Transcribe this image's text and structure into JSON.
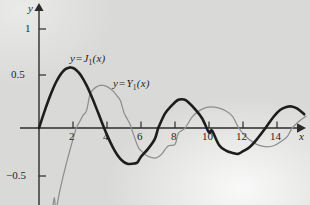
{
  "chart_data": {
    "type": "line",
    "title": "",
    "xlabel": "x",
    "ylabel": "y",
    "xlim": [
      -0.3,
      15.8
    ],
    "ylim": [
      -0.75,
      1.18
    ],
    "grid": false,
    "legend_position": "inline-annotations",
    "xticks": [
      2,
      4,
      6,
      8,
      10,
      12,
      14
    ],
    "xtick_labels": [
      "2",
      "4",
      "6",
      "8",
      "10",
      "12",
      "14"
    ],
    "yticks": [
      1,
      0.5,
      -0.5
    ],
    "ytick_labels": [
      "1",
      "0.5",
      "−0.5"
    ],
    "annotations": [
      {
        "text_y": "y",
        "text_eq": "=",
        "text_fn": "J",
        "text_sub": "1",
        "text_arg": "(x)",
        "at_x": 2.6,
        "at_y": 0.72
      },
      {
        "text_y": "y",
        "text_eq": "=",
        "text_fn": "Y",
        "text_sub": "1",
        "text_arg": "(x)",
        "at_x": 5.1,
        "at_y": 0.45
      }
    ],
    "series": [
      {
        "name": "J_1(x)",
        "label": "y = J₁(x)",
        "color": "#1d1d1d",
        "linewidth": 2.6,
        "x": [
          0,
          0.2,
          0.4,
          0.6,
          0.8,
          1,
          1.2,
          1.4,
          1.6,
          1.8,
          1.841,
          2,
          2.2,
          2.4,
          2.6,
          2.8,
          3,
          3.2,
          3.4,
          3.6,
          3.8,
          3.832,
          4,
          4.2,
          4.4,
          4.6,
          4.8,
          5,
          5.2,
          5.331,
          5.6,
          5.8,
          6,
          6.4,
          6.8,
          7,
          7.016,
          7.4,
          7.8,
          8.2,
          8.536,
          8.8,
          9.2,
          9.6,
          10,
          10.174,
          10.6,
          11,
          11.4,
          11.706,
          12,
          12.4,
          12.8,
          13.324,
          13.8,
          14.2,
          14.6,
          14.864,
          15.2,
          15.6
        ],
        "y": [
          0,
          0.0995,
          0.196,
          0.2867,
          0.3688,
          0.4401,
          0.4983,
          0.5419,
          0.5699,
          0.5815,
          0.5819,
          0.5767,
          0.556,
          0.5202,
          0.4708,
          0.4097,
          0.3391,
          0.2613,
          0.1792,
          0.0955,
          0.0128,
          0,
          -0.066,
          -0.1386,
          -0.2028,
          -0.2566,
          -0.2985,
          -0.3276,
          -0.3432,
          -0.3461,
          -0.3414,
          -0.329,
          -0.2767,
          -0.2028,
          -0.1096,
          -0.0047,
          0,
          0.1352,
          0.215,
          0.2715,
          0.273,
          0.2453,
          0.1768,
          0.0915,
          -0.0435,
          -0.0249,
          -0.1655,
          -0.2167,
          -0.2402,
          -0.249,
          -0.2234,
          -0.183,
          -0.1119,
          0,
          0.1087,
          0.1757,
          0.2045,
          0.2061,
          0.186,
          0.1322
        ]
      },
      {
        "name": "Y_1(x)",
        "label": "y = Y₁(x)",
        "color": "#8e8e8e",
        "linewidth": 1.25,
        "x": [
          0.62,
          0.7,
          0.8,
          0.9,
          1,
          1.2,
          1.4,
          1.6,
          1.8,
          2,
          2.197,
          2.4,
          2.6,
          2.8,
          3,
          3.2,
          3.4,
          3.6,
          3.683,
          3.8,
          4,
          4.2,
          4.4,
          4.6,
          4.8,
          5,
          5.2,
          5.4,
          5.429,
          5.8,
          6,
          6.4,
          6.8,
          7,
          7.2,
          7.6,
          8,
          8.2,
          8.596,
          9,
          9.4,
          9.8,
          10.1,
          10.5,
          11,
          11.4,
          11.749,
          12.2,
          12.6,
          13,
          13.4,
          13.8,
          14.2,
          14.6,
          14.897,
          15.3,
          15.7
        ],
        "y": [
          -1.08,
          -0.9309,
          -0.7812,
          -0.6687,
          -0.7812,
          -0.6211,
          -0.4791,
          -0.3476,
          -0.2237,
          -0.107,
          0,
          0.0628,
          0.1231,
          0.1691,
          0.3247,
          0.3707,
          0.3979,
          0.4102,
          0.4102,
          0.4097,
          0.3979,
          0.3767,
          0.3476,
          0.3071,
          0.2591,
          0.1479,
          0.0843,
          0.0203,
          0,
          -0.1712,
          -0.2175,
          -0.2723,
          -0.2891,
          -0.279,
          -0.2536,
          -0.1732,
          -0.1581,
          -0.0493,
          0,
          0.1043,
          0.1622,
          0.1957,
          0.204,
          0.1963,
          0.1637,
          0.1098,
          0,
          -0.0867,
          -0.1385,
          -0.1703,
          -0.1811,
          -0.1709,
          -0.1349,
          -0.0824,
          0,
          0.0653,
          0.1138
        ]
      }
    ]
  },
  "axes": {
    "y_axis_label": "y",
    "x_axis_label": "x"
  }
}
